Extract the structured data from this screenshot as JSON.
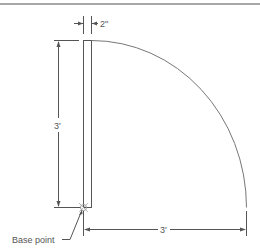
{
  "diagram": {
    "type": "door-plan-drawing",
    "labels": {
      "door_thickness": "2\"",
      "door_height_dimension": "3'",
      "swing_radius_dimension": "3'",
      "base_point": "Base point"
    },
    "colors": {
      "line": "#555555",
      "arc": "#777777",
      "border": "#a6a6a6",
      "base_point_marker": "#999999"
    }
  }
}
